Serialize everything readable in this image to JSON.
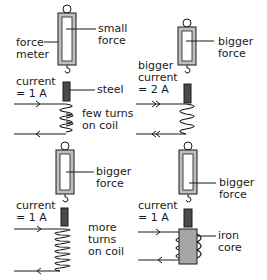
{
  "colors": {
    "line": "#1a1a1a",
    "meter_frame": "#bfbfbf",
    "steel": "#4a4a4a",
    "iron_core": "#a6a6a6"
  },
  "panels": [
    {
      "id": "few-turns",
      "labels": {
        "meter": [
          "force",
          "meter"
        ],
        "force": [
          "small",
          "force"
        ],
        "current": [
          "current",
          "= 1 A"
        ],
        "steel": "steel",
        "coil": [
          "few turns",
          "on coil"
        ]
      }
    },
    {
      "id": "bigger-current",
      "labels": {
        "force": [
          "bigger",
          "force"
        ],
        "current": [
          "bigger",
          "current",
          "= 2 A"
        ]
      }
    },
    {
      "id": "more-turns",
      "labels": {
        "force": [
          "bigger",
          "force"
        ],
        "current": [
          "current",
          "= 1 A"
        ],
        "coil": [
          "more",
          "turns",
          "on coil"
        ]
      }
    },
    {
      "id": "iron-core",
      "labels": {
        "force": [
          "bigger",
          "force"
        ],
        "current": [
          "current",
          "= 1 A"
        ],
        "core": [
          "iron",
          "core"
        ]
      }
    }
  ]
}
